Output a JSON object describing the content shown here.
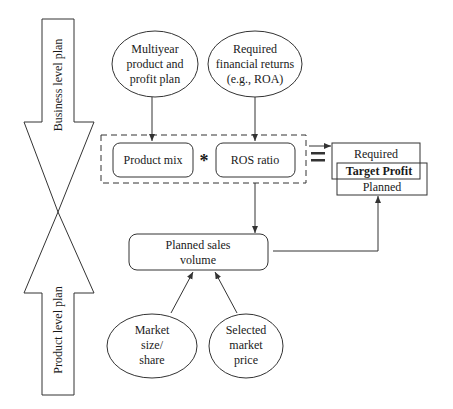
{
  "diagram": {
    "side_arrows": {
      "top": {
        "label": "Business level plan",
        "direction": "down"
      },
      "bottom": {
        "label": "Product level plan",
        "direction": "up"
      }
    },
    "inputs_top": [
      {
        "lines": [
          "Multiyear",
          "product and",
          "profit plan"
        ]
      },
      {
        "lines": [
          "Required",
          "financial returns",
          "(e.g., ROA)"
        ]
      }
    ],
    "formula": {
      "left": "Product mix",
      "operator": "*",
      "right": "ROS ratio",
      "equals": "="
    },
    "target": {
      "required": "Required",
      "title": "Target Profit",
      "planned": "Planned"
    },
    "sales": {
      "lines": [
        "Planned sales",
        "volume"
      ]
    },
    "inputs_bottom": [
      {
        "lines": [
          "Market",
          "size/",
          "share"
        ]
      },
      {
        "lines": [
          "Selected",
          "market",
          "price"
        ]
      }
    ],
    "colors": {
      "stroke": "#333333",
      "text": "#1a1a1a",
      "background": "#ffffff"
    }
  }
}
